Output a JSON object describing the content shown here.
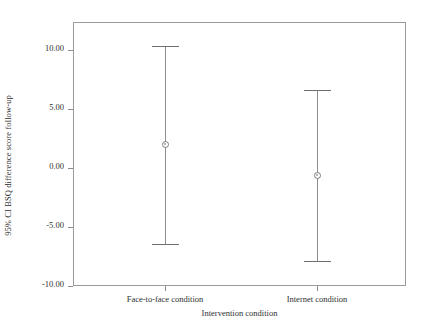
{
  "chart_data": {
    "type": "scatter",
    "title": "",
    "xlabel": "Intervention condition",
    "ylabel": "95% CI BSQ difference score follow-up",
    "categories": [
      "Face-to-face condition",
      "Internet condition"
    ],
    "ylim": [
      -10.0,
      10.0
    ],
    "ytick_labels": [
      "10.00",
      "5.00",
      "0.00",
      "-5.00",
      "-10.00"
    ],
    "ytick_values": [
      10.0,
      5.0,
      0.0,
      -5.0,
      -10.0
    ],
    "grid": false,
    "legend": "none",
    "series": [
      {
        "name": "95% CI BSQ difference score follow-up",
        "points": [
          {
            "category": "Face-to-face condition",
            "mean": 2.0,
            "ci_lower": -6.4,
            "ci_upper": 10.3
          },
          {
            "category": "Internet condition",
            "mean": -0.6,
            "ci_lower": -7.9,
            "ci_upper": 6.6
          }
        ]
      }
    ]
  },
  "axis": {
    "y_title": "95% CI BSQ difference score follow-up",
    "x_title": "Intervention condition",
    "yticks": [
      {
        "label": "10.00",
        "value": 10.0
      },
      {
        "label": "5.00",
        "value": 5.0
      },
      {
        "label": "0.00",
        "value": 0.0
      },
      {
        "label": "-5.00",
        "value": -5.0
      },
      {
        "label": "-10.00",
        "value": -10.0
      }
    ],
    "xticks": [
      {
        "label": "Face-to-face condition"
      },
      {
        "label": "Internet condition"
      }
    ]
  },
  "colors": {
    "line": "#8e8e8e",
    "cap": "#6f6f6f",
    "frame": "#9a9a9a",
    "text": "#2f2f2f",
    "background": "#ffffff"
  }
}
